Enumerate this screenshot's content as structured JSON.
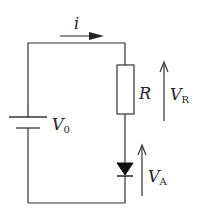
{
  "diagram": {
    "type": "circuit",
    "current": {
      "label": "i"
    },
    "source": {
      "label": "V",
      "subscript": "0"
    },
    "resistor": {
      "label": "R"
    },
    "resistor_voltage": {
      "label": "V",
      "subscript": "R"
    },
    "diode_voltage": {
      "label": "V",
      "subscript": "A"
    },
    "colors": {
      "stroke": "#333333",
      "background": "#ffffff"
    }
  }
}
